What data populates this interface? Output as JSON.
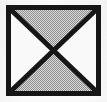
{
  "figure": {
    "name": "hourglass-bowtie-square-symbol",
    "title": "Square symbol with crossed diagonals",
    "width": 107,
    "height": 102
  },
  "canvas": {
    "background_color": "#fcfcfc",
    "paper_tint": "#fdfdfd"
  },
  "square": {
    "label": "outer-square",
    "left": 6,
    "top": 5,
    "right": 101,
    "bottom": 96,
    "width": 95,
    "height": 91,
    "border_color": "#161616",
    "border_width_px": 5,
    "inner_left": 10,
    "inner_top": 9,
    "inner_right": 97,
    "inner_bottom": 92
  },
  "diagonals": {
    "label": "crossed-diagonals",
    "stroke_color": "#161616",
    "stroke_width_px": 5,
    "intersection": {
      "x": 53.5,
      "y": 50.5
    },
    "lines": [
      {
        "name": "diagonal-top-left-to-bottom-right",
        "x1": 10,
        "y1": 9,
        "x2": 97,
        "y2": 92
      },
      {
        "name": "diagonal-top-right-to-bottom-left",
        "x1": 97,
        "y1": 9,
        "x2": 10,
        "y2": 92
      }
    ]
  },
  "triangles": [
    {
      "name": "triangle-top",
      "position": "top",
      "fill_label": "gray halftone screen",
      "fill_color": "#c9c9c9",
      "points": "10,9 97,9 53.5,50.5"
    },
    {
      "name": "triangle-right",
      "position": "right",
      "fill_label": "white",
      "fill_color": "#fbfbfb",
      "points": "97,9 97,92 53.5,50.5"
    },
    {
      "name": "triangle-bottom",
      "position": "bottom",
      "fill_label": "gray halftone screen",
      "fill_color": "#c9c9c9",
      "points": "10,92 97,92 53.5,50.5"
    },
    {
      "name": "triangle-left",
      "position": "left",
      "fill_label": "white",
      "fill_color": "#fbfbfb",
      "points": "10,9 10,92 53.5,50.5"
    }
  ],
  "halftone": {
    "label": "dither-screen",
    "dot_color": "#8f8f8f",
    "base_color": "#dcdcdc",
    "cell_size_px": 2
  }
}
